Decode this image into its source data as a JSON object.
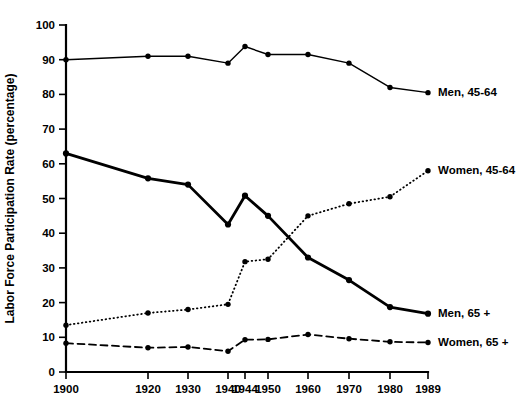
{
  "chart_data": {
    "type": "line",
    "title": "",
    "xlabel": "",
    "ylabel": "Labor Force Participation Rate (percentage)",
    "ylim": [
      0,
      100
    ],
    "ytick_labels": [
      "0",
      "10",
      "20",
      "30",
      "40",
      "50",
      "60",
      "70",
      "80",
      "90",
      "100"
    ],
    "yticks": [
      0,
      10,
      20,
      30,
      40,
      50,
      60,
      70,
      80,
      90,
      100
    ],
    "grid": false,
    "legend_position": "inline-right",
    "x": [
      1900,
      1920,
      1930,
      1940,
      1944,
      1950,
      1960,
      1970,
      1980,
      1989
    ],
    "xtick_labels": [
      "1900",
      "1920",
      "1930",
      "1940",
      "1944",
      "1950",
      "1960",
      "1970",
      "1980",
      "1989"
    ],
    "series": [
      {
        "name": "Men, 45-64",
        "label": "Men, 45-64",
        "style": "solid",
        "stroke_width": 1.4,
        "color": "#000000",
        "values": [
          90.0,
          91.0,
          91.0,
          89.0,
          93.8,
          91.5,
          91.5,
          89.0,
          82.0,
          80.5
        ]
      },
      {
        "name": "Women, 45-64",
        "label": "Women, 45-64",
        "style": "dotted",
        "stroke_width": 1.8,
        "color": "#000000",
        "values": [
          13.5,
          17.0,
          18.0,
          19.5,
          31.8,
          32.5,
          45.0,
          48.5,
          50.5,
          58.0
        ]
      },
      {
        "name": "Men, 65 +",
        "label": "Men, 65 +",
        "style": "solid",
        "stroke_width": 2.8,
        "color": "#000000",
        "values": [
          63.0,
          55.8,
          54.0,
          42.5,
          50.8,
          45.0,
          33.0,
          26.5,
          18.7,
          16.8
        ]
      },
      {
        "name": "Women, 65 +",
        "label": "Women, 65 +",
        "style": "dashed",
        "stroke_width": 1.8,
        "color": "#000000",
        "values": [
          8.3,
          7.0,
          7.2,
          6.0,
          9.3,
          9.4,
          10.8,
          9.6,
          8.7,
          8.5
        ]
      }
    ]
  },
  "axes": {
    "y_axis_title": "Labor Force Participation Rate (percentage)"
  }
}
